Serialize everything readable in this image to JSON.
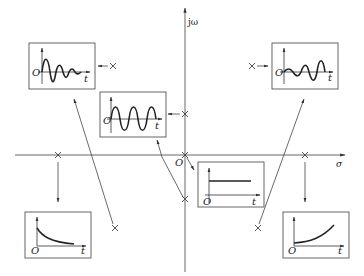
{
  "diagram": {
    "axes": {
      "vertical_label": "jω",
      "horizontal_label": "σ",
      "origin_label": "O"
    },
    "inset_axis_labels": {
      "origin": "O",
      "time": "t"
    },
    "poles": [
      {
        "id": "left-upper",
        "x": 113,
        "y": 66,
        "response": "damped-oscillation"
      },
      {
        "id": "imag-upper",
        "x": 185,
        "y": 114,
        "response": "sustained-oscillation"
      },
      {
        "id": "right-upper",
        "x": 252,
        "y": 66,
        "response": "growing-oscillation"
      },
      {
        "id": "origin",
        "x": 185,
        "y": 155,
        "response": "constant"
      },
      {
        "id": "imag-lower",
        "x": 185,
        "y": 199,
        "response": "sustained-oscillation"
      },
      {
        "id": "real-left",
        "x": 58,
        "y": 155,
        "response": "exponential-decay"
      },
      {
        "id": "real-right",
        "x": 305,
        "y": 155,
        "response": "exponential-growth"
      },
      {
        "id": "left-lower",
        "x": 115,
        "y": 228,
        "response": "damped-oscillation"
      },
      {
        "id": "right-lower",
        "x": 258,
        "y": 228,
        "response": "growing-oscillation"
      }
    ],
    "insets": [
      {
        "id": "damped-oscillation",
        "label": "Damped oscillation"
      },
      {
        "id": "sustained-oscillation",
        "label": "Sustained oscillation"
      },
      {
        "id": "growing-oscillation",
        "label": "Growing oscillation"
      },
      {
        "id": "constant",
        "label": "Constant"
      },
      {
        "id": "exponential-decay",
        "label": "Exponential decay"
      },
      {
        "id": "exponential-growth",
        "label": "Exponential growth"
      }
    ]
  }
}
